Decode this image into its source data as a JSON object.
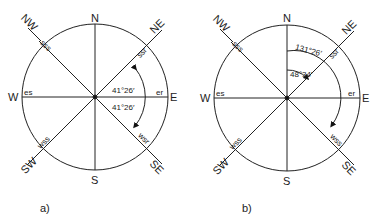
{
  "diagrams": [
    {
      "id": "a",
      "caption": "a)",
      "directions": {
        "N": "N",
        "S": "S",
        "E": "E",
        "W": "W",
        "NE": "NE",
        "NW": "NW",
        "SE": "SE",
        "SW": "SW"
      },
      "markers": {
        "nw": "sss",
        "ne": "ssr",
        "w": "es",
        "e": "er",
        "sw": "wss",
        "se": "wsr"
      },
      "angles": [
        "41°26′",
        "41°26′"
      ]
    },
    {
      "id": "b",
      "caption": "b)",
      "directions": {
        "N": "N",
        "S": "S",
        "E": "E",
        "W": "W",
        "NE": "NE",
        "NW": "NW",
        "SE": "SE",
        "SW": "SW"
      },
      "markers": {
        "nw": "sss",
        "ne": "ssr",
        "w": "es",
        "e": "er",
        "sw": "wss",
        "se": "wss"
      },
      "angles": [
        "131°26′",
        "48°34′"
      ]
    }
  ]
}
